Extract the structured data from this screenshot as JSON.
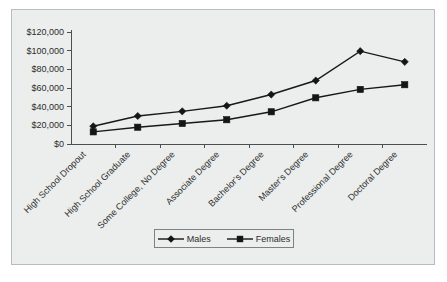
{
  "chart_data": {
    "type": "line",
    "title": "",
    "subtitle": "",
    "xlabel": "",
    "ylabel": "",
    "ylim": [
      0,
      120000
    ],
    "ytick_labels": [
      "$0",
      "$20,000",
      "$40,000",
      "$60,000",
      "$80,000",
      "$100,000",
      "$120,000"
    ],
    "ytick_values": [
      0,
      20000,
      40000,
      60000,
      80000,
      100000,
      120000
    ],
    "grid": false,
    "legend_position": "bottom",
    "categories": [
      "High School Dropout",
      "High School Graduate",
      "Some College, No Degree",
      "Associate Degree",
      "Bachelor's Degree",
      "Master's Degree",
      "Professional Degree",
      "Doctoral Degree"
    ],
    "series": [
      {
        "name": "Males",
        "marker": "diamond",
        "color": "#131516",
        "values": [
          19000,
          30000,
          35000,
          41000,
          53000,
          68000,
          99500,
          88000
        ]
      },
      {
        "name": "Females",
        "marker": "square",
        "color": "#131516",
        "values": [
          13000,
          18000,
          22000,
          26000,
          34500,
          49500,
          58500,
          63500
        ]
      }
    ]
  },
  "legend": {
    "entries": [
      {
        "label": "Males",
        "marker": "diamond-marker-icon"
      },
      {
        "label": "Females",
        "marker": "square-marker-icon"
      }
    ]
  },
  "colors": {
    "panel_background": "#eceded",
    "panel_border": "#b9bcbd",
    "axis": "#4c4f50",
    "series": "#131516",
    "text": "#2b2d2e",
    "page_background": "#ffffff"
  }
}
